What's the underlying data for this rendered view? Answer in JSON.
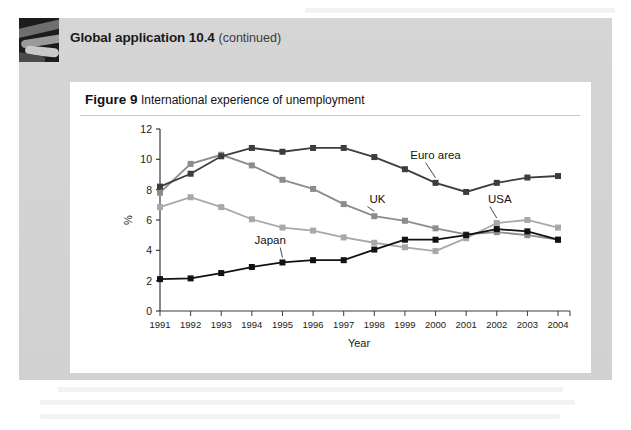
{
  "panel": {
    "title_strong": "Global application 10.4",
    "title_continued": "(continued)",
    "thumbnail_name": "photo-thumbnail"
  },
  "figure": {
    "label": "Figure 9",
    "caption": "International experience of unemployment"
  },
  "chart_data": {
    "type": "line",
    "title": "International experience of unemployment",
    "xlabel": "Year",
    "ylabel": "%",
    "categories": [
      "1991",
      "1992",
      "1993",
      "1994",
      "1995",
      "1996",
      "1997",
      "1998",
      "1999",
      "2000",
      "2001",
      "2002",
      "2003",
      "2004"
    ],
    "x": [
      1991,
      1992,
      1993,
      1994,
      1995,
      1996,
      1997,
      1998,
      1999,
      2000,
      2001,
      2002,
      2003,
      2004
    ],
    "ylim": [
      0,
      12
    ],
    "yticks": [
      0,
      2,
      4,
      6,
      8,
      10,
      12
    ],
    "grid": false,
    "legend": "inline-annotations",
    "series": [
      {
        "name": "Euro area",
        "color": "#3d3d3d",
        "marker": "square",
        "values": [
          8.2,
          9.05,
          10.2,
          10.75,
          10.5,
          10.75,
          10.75,
          10.15,
          9.35,
          8.45,
          7.85,
          8.45,
          8.8,
          8.9
        ],
        "label_x": 2000.0,
        "label_y": 10.05
      },
      {
        "name": "UK",
        "color": "#8c8c8c",
        "marker": "square",
        "values": [
          7.8,
          9.7,
          10.3,
          9.6,
          8.65,
          8.05,
          7.05,
          6.25,
          5.95,
          5.45,
          5.05,
          5.2,
          5.0,
          4.7
        ],
        "label_x": 1998.1,
        "label_y": 7.15
      },
      {
        "name": "USA",
        "color": "#a8a8a8",
        "marker": "square",
        "values": [
          6.85,
          7.5,
          6.85,
          6.05,
          5.5,
          5.3,
          4.85,
          4.5,
          4.2,
          3.95,
          4.8,
          5.8,
          6.0,
          5.5
        ],
        "label_x": 2002.1,
        "label_y": 7.15
      },
      {
        "name": "Japan",
        "color": "#111111",
        "marker": "square",
        "values": [
          2.1,
          2.15,
          2.5,
          2.9,
          3.2,
          3.35,
          3.35,
          4.05,
          4.7,
          4.7,
          5.0,
          5.4,
          5.25,
          4.7
        ],
        "label_x": 1994.6,
        "label_y": 4.45
      }
    ],
    "annotations": [
      {
        "text": "Euro area",
        "series": "Euro area"
      },
      {
        "text": "UK",
        "series": "UK"
      },
      {
        "text": "USA",
        "series": "USA"
      },
      {
        "text": "Japan",
        "series": "Japan"
      }
    ]
  }
}
